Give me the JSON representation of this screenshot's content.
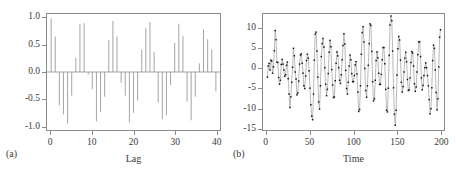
{
  "figure": {
    "panels": [
      {
        "tag": "(a)",
        "type": "acf"
      },
      {
        "tag": "(b)",
        "type": "series"
      }
    ],
    "colors": {
      "frame": "#8a8a8a",
      "stem": "#9a9a9a",
      "line": "#9a9a9a",
      "marker": "#141414",
      "text": "#3a3a3a",
      "background": "#ffffff"
    }
  },
  "chart_data": [
    {
      "type": "bar",
      "panel": "(a)",
      "title": "",
      "xlabel": "Lag",
      "ylabel": "",
      "xlim": [
        -1,
        41
      ],
      "ylim": [
        -1.08,
        1.08
      ],
      "xticks": [
        0,
        10,
        20,
        30,
        40
      ],
      "xtick_labels": [
        "0",
        "10",
        "20",
        "30",
        "40"
      ],
      "yticks": [
        1.0,
        0.5,
        0.0,
        -0.5,
        -1.0
      ],
      "ytick_labels": [
        "1.0",
        "0.5",
        "0.0",
        "-0.5",
        "-1.0"
      ],
      "grid": false,
      "legend": null,
      "zero_line": 0.0,
      "categories": [
        0,
        1,
        2,
        3,
        4,
        5,
        6,
        7,
        8,
        9,
        10,
        11,
        12,
        13,
        14,
        15,
        16,
        17,
        18,
        19,
        20,
        21,
        22,
        23,
        24,
        25,
        26,
        27,
        28,
        29,
        30,
        31,
        32,
        33,
        34,
        35,
        36,
        37,
        38,
        39,
        40
      ],
      "values": [
        1.0,
        0.66,
        -0.62,
        -0.79,
        -0.96,
        -0.44,
        0.26,
        0.9,
        0.91,
        -0.05,
        -0.32,
        -0.92,
        -0.74,
        -0.46,
        0.6,
        0.95,
        0.66,
        -0.2,
        -0.44,
        -0.94,
        -0.76,
        -0.53,
        0.42,
        0.82,
        0.93,
        0.37,
        -0.57,
        -0.88,
        -0.81,
        -0.24,
        0.54,
        0.9,
        0.67,
        -0.55,
        -0.9,
        -0.46,
        0.16,
        0.79,
        0.61,
        0.42,
        -0.36
      ]
    },
    {
      "type": "line",
      "panel": "(b)",
      "title": "",
      "xlabel": "Time",
      "ylabel": "",
      "xlim": [
        -4,
        204
      ],
      "ylim": [
        -15.6,
        13.8
      ],
      "xticks": [
        0,
        50,
        100,
        150,
        200
      ],
      "xtick_labels": [
        "0",
        "50",
        "100",
        "150",
        "200"
      ],
      "yticks": [
        10,
        5,
        0,
        -5,
        -10,
        -15
      ],
      "ytick_labels": [
        "10",
        "5",
        "0",
        "-5",
        "-10",
        "-15"
      ],
      "grid": false,
      "legend": null,
      "markers": true,
      "x": [
        1,
        2,
        3,
        4,
        5,
        6,
        7,
        8,
        9,
        10,
        11,
        12,
        13,
        14,
        15,
        16,
        17,
        18,
        19,
        20,
        21,
        22,
        23,
        24,
        25,
        26,
        27,
        28,
        29,
        30,
        31,
        32,
        33,
        34,
        35,
        36,
        37,
        38,
        39,
        40,
        41,
        42,
        43,
        44,
        45,
        46,
        47,
        48,
        49,
        50,
        51,
        52,
        53,
        54,
        55,
        56,
        57,
        58,
        59,
        60,
        61,
        62,
        63,
        64,
        65,
        66,
        67,
        68,
        69,
        70,
        71,
        72,
        73,
        74,
        75,
        76,
        77,
        78,
        79,
        80,
        81,
        82,
        83,
        84,
        85,
        86,
        87,
        88,
        89,
        90,
        91,
        92,
        93,
        94,
        95,
        96,
        97,
        98,
        99,
        100,
        101,
        102,
        103,
        104,
        105,
        106,
        107,
        108,
        109,
        110,
        111,
        112,
        113,
        114,
        115,
        116,
        117,
        118,
        119,
        120,
        121,
        122,
        123,
        124,
        125,
        126,
        127,
        128,
        129,
        130,
        131,
        132,
        133,
        134,
        135,
        136,
        137,
        138,
        139,
        140,
        141,
        142,
        143,
        144,
        145,
        146,
        147,
        148,
        149,
        150,
        151,
        152,
        153,
        154,
        155,
        156,
        157,
        158,
        159,
        160,
        161,
        162,
        163,
        164,
        165,
        166,
        167,
        168,
        169,
        170,
        171,
        172,
        173,
        174,
        175,
        176,
        177,
        178,
        179,
        180,
        181,
        182,
        183,
        184,
        185,
        186,
        187,
        188,
        189,
        190,
        191,
        192,
        193,
        194,
        195,
        196,
        197,
        198,
        199,
        200
      ],
      "y": [
        -2.2,
        0.6,
        1.3,
        -0.4,
        2.1,
        1.9,
        -1.2,
        0.4,
        4.5,
        9.6,
        7.3,
        1.6,
        1.5,
        -2.3,
        -4.0,
        -3.0,
        1.0,
        2.3,
        1.1,
        -0.4,
        -2.0,
        -1.6,
        0.8,
        1.6,
        -2.6,
        -6.5,
        -9.9,
        -7.2,
        -3.5,
        0.3,
        5.1,
        3.2,
        -0.9,
        -2.7,
        -6.7,
        -6.2,
        -3.2,
        1.1,
        3.4,
        3.7,
        1.3,
        -1.2,
        -4.4,
        -5.1,
        -1.9,
        2.0,
        3.6,
        2.6,
        -0.6,
        -5.0,
        -9.2,
        -12.1,
        -13.0,
        -6.5,
        2.1,
        8.7,
        9.2,
        4.4,
        -2.2,
        -8.5,
        -10.3,
        -4.4,
        3.0,
        6.3,
        7.6,
        5.4,
        0.2,
        -4.0,
        -6.9,
        -5.3,
        -1.3,
        4.1,
        7.1,
        5.5,
        -0.3,
        -4.2,
        -7.4,
        -7.2,
        -3.1,
        1.3,
        4.2,
        3.2,
        0.2,
        -3.0,
        -3.8,
        -1.6,
        2.2,
        5.8,
        8.8,
        6.2,
        -0.5,
        -5.1,
        -6.5,
        -3.5,
        0.6,
        3.4,
        2.2,
        -1.3,
        -3.4,
        -3.3,
        -1.8,
        0.9,
        1.7,
        -1.4,
        -6.0,
        -10.9,
        -10.4,
        -4.4,
        3.6,
        9.1,
        10.6,
        6.7,
        0.0,
        -5.6,
        -7.3,
        -4.4,
        0.8,
        6.3,
        11.3,
        10.9,
        4.3,
        -3.4,
        -8.2,
        -7.7,
        -3.0,
        2.0,
        4.2,
        2.7,
        -1.2,
        -4.1,
        -4.0,
        -1.5,
        2.2,
        5.3,
        5.3,
        1.2,
        -5.3,
        -10.6,
        -11.0,
        -5.0,
        3.3,
        11.0,
        13.3,
        12.1,
        4.4,
        -4.9,
        -11.6,
        -14.4,
        -10.6,
        -1.7,
        5.0,
        8.1,
        7.2,
        2.1,
        -3.5,
        -6.0,
        -4.6,
        -0.9,
        2.6,
        4.1,
        1.7,
        -2.8,
        -5.6,
        -5.4,
        -2.4,
        1.5,
        4.3,
        3.9,
        0.6,
        -3.9,
        -5.8,
        -4.7,
        -0.9,
        3.5,
        6.7,
        6.8,
        3.0,
        -2.4,
        -5.4,
        -4.3,
        -1.8,
        0.2,
        1.4,
        0.2,
        -1.8,
        -4.4,
        -7.9,
        -11.5,
        -10.2,
        -4.9,
        2.0,
        5.9,
        5.1,
        -0.4,
        -6.1,
        -10.5,
        -7.7,
        0.4,
        7.9,
        9.8
      ]
    }
  ]
}
